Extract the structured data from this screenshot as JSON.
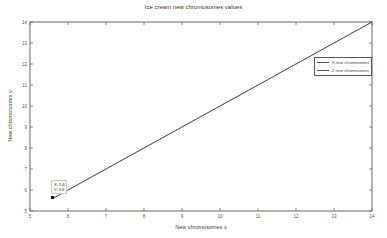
{
  "chart_data": {
    "type": "line",
    "title": "Ice cream new chromosomes values",
    "xlabel": "New chromosomes x",
    "ylabel": "New chromosomes y",
    "xlim": [
      5,
      14
    ],
    "ylim": [
      5,
      14
    ],
    "xticks": [
      5,
      6,
      7,
      8,
      9,
      10,
      11,
      12,
      13,
      14
    ],
    "yticks": [
      5,
      6,
      7,
      8,
      9,
      10,
      11,
      12,
      13,
      14
    ],
    "grid": false,
    "legend_position": "upper right",
    "series": [
      {
        "name": "X new chromosomes",
        "x": [
          5.6,
          14
        ],
        "y": [
          5.6,
          14
        ],
        "color": "#555555"
      },
      {
        "name": "Z new chromosomes",
        "x": [
          5.6,
          14
        ],
        "y": [
          5.6,
          14
        ],
        "color": "#555555"
      }
    ],
    "annotations": [
      {
        "type": "datatip",
        "x": 5.6,
        "y": 5.6,
        "text_x": "X: 5.6",
        "text_y": "Y: 5.6"
      }
    ]
  },
  "legend": {
    "items": [
      {
        "label": "X new chromosomes"
      },
      {
        "label": "Z new chromosomes"
      }
    ]
  },
  "datatip": {
    "x_text": "X: 5.6",
    "y_text": "Y: 5.6"
  }
}
